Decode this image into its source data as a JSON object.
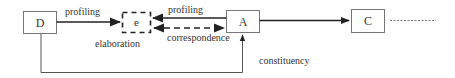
{
  "diagram": {
    "nodes": {
      "d": {
        "label": "D"
      },
      "e": {
        "label": "e"
      },
      "a": {
        "label": "A"
      },
      "c": {
        "label": "C"
      }
    },
    "edges": {
      "d_to_e": {
        "label": "profiling"
      },
      "a_to_e": {
        "label": "profiling"
      },
      "e_a_correspondence": {
        "label": "correspondence"
      },
      "e_elaboration": {
        "label": "elaboration"
      },
      "d_to_a": {
        "label": "constituency"
      }
    },
    "colors": {
      "stroke": "#444444",
      "box_border": "#777777",
      "text": "#333333"
    }
  }
}
